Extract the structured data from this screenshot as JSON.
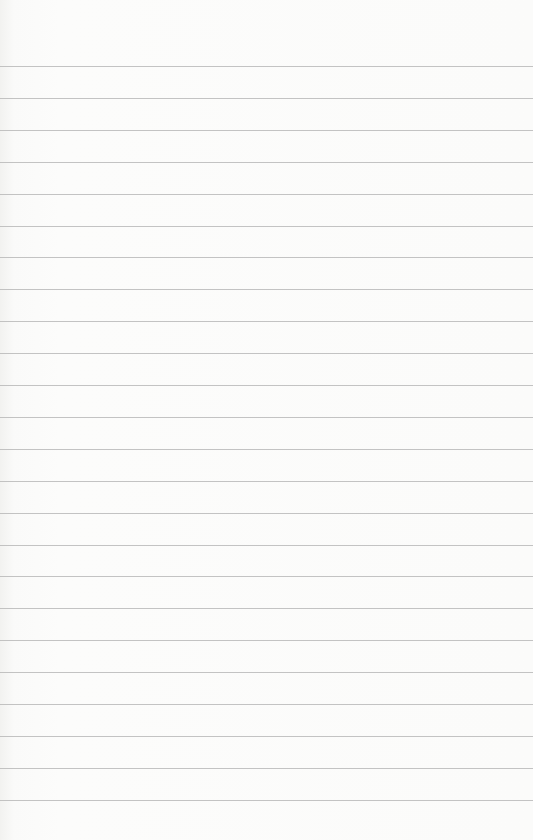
{
  "paper": {
    "type": "lined-paper",
    "background_color": "#fbfbfa",
    "line_color": "#b9b9b9",
    "line_count": 24,
    "first_line_y": 66,
    "line_spacing": 31.9
  }
}
